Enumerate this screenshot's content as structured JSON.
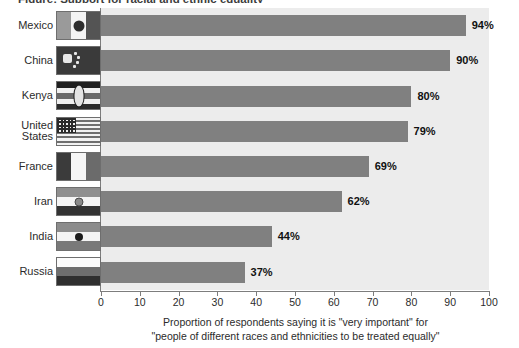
{
  "figure": {
    "title_clipped": "Figure: Support for racial and ethnic equality",
    "background": "#ffffff",
    "plot_background": "#ececec",
    "bar_color": "#808080",
    "axis_color": "#7d7d7d"
  },
  "caption": {
    "line1": "Proportion of respondents saying it is \"very important\" for",
    "line2": "\"people of different races and ethnicities to be treated equally\""
  },
  "chart_data": {
    "type": "bar",
    "orientation": "horizontal",
    "title": "",
    "xlabel": "Proportion of respondents saying it is \"very important\" for \"people of different races and ethnicities to be treated equally\"",
    "ylabel": "",
    "xlim": [
      0,
      100
    ],
    "xticks": [
      0,
      10,
      20,
      30,
      40,
      50,
      60,
      70,
      80,
      90,
      100
    ],
    "grid": false,
    "legend": "none",
    "categories": [
      "Mexico",
      "China",
      "Kenya",
      "United States",
      "France",
      "Iran",
      "India",
      "Russia"
    ],
    "values": [
      94,
      90,
      80,
      79,
      69,
      62,
      44,
      37
    ],
    "value_labels": [
      "94%",
      "90%",
      "80%",
      "79%",
      "69%",
      "62%",
      "44%",
      "37%"
    ]
  },
  "rows": [
    {
      "label": "Mexico",
      "value": 94,
      "value_label": "94%",
      "flag": "mexico-flag"
    },
    {
      "label": "China",
      "value": 90,
      "value_label": "90%",
      "flag": "china-flag"
    },
    {
      "label": "Kenya",
      "value": 80,
      "value_label": "80%",
      "flag": "kenya-flag"
    },
    {
      "label": "United\nStates",
      "value": 79,
      "value_label": "79%",
      "flag": "united-states-flag"
    },
    {
      "label": "France",
      "value": 69,
      "value_label": "69%",
      "flag": "france-flag"
    },
    {
      "label": "Iran",
      "value": 62,
      "value_label": "62%",
      "flag": "iran-flag"
    },
    {
      "label": "India",
      "value": 44,
      "value_label": "44%",
      "flag": "india-flag"
    },
    {
      "label": "Russia",
      "value": 37,
      "value_label": "37%",
      "flag": "russia-flag"
    }
  ],
  "axis": {
    "ticks": [
      "0",
      "10",
      "20",
      "30",
      "40",
      "50",
      "60",
      "70",
      "80",
      "90",
      "100"
    ]
  }
}
